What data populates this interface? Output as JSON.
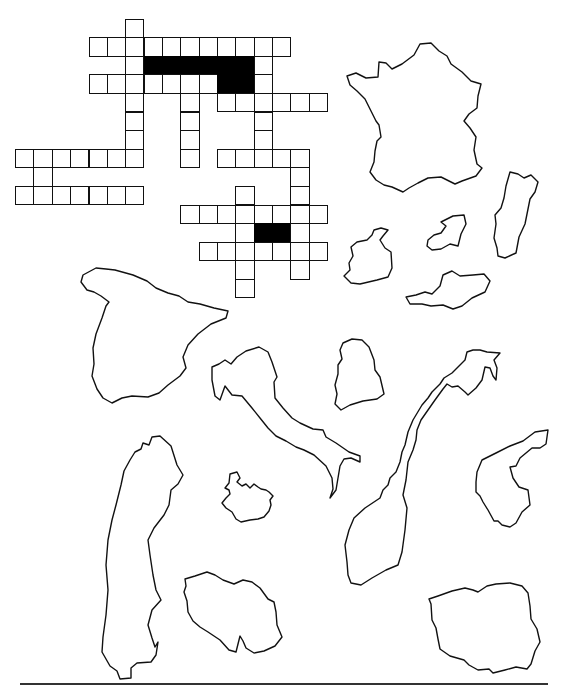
{
  "worksheet": {
    "title": "European countries crossword with outline maps",
    "crossword": {
      "cell_origin_note": "grid coordinates: row index, column index (column 0 = first cell of the long top-left across row)",
      "cells": [
        {
          "r": 0,
          "c": 2
        },
        {
          "r": 1,
          "c": 0
        },
        {
          "r": 1,
          "c": 1
        },
        {
          "r": 1,
          "c": 2
        },
        {
          "r": 1,
          "c": 3
        },
        {
          "r": 1,
          "c": 4
        },
        {
          "r": 1,
          "c": 5
        },
        {
          "r": 1,
          "c": 6
        },
        {
          "r": 1,
          "c": 7
        },
        {
          "r": 1,
          "c": 8
        },
        {
          "r": 1,
          "c": 9
        },
        {
          "r": 1,
          "c": 10
        },
        {
          "r": 2,
          "c": 2
        },
        {
          "r": 2,
          "c": 3,
          "black": true
        },
        {
          "r": 2,
          "c": 4,
          "black": true
        },
        {
          "r": 2,
          "c": 5,
          "black": true
        },
        {
          "r": 2,
          "c": 6,
          "black": true
        },
        {
          "r": 2,
          "c": 7,
          "black": true
        },
        {
          "r": 2,
          "c": 8,
          "black": true
        },
        {
          "r": 2,
          "c": 9
        },
        {
          "r": 3,
          "c": 0
        },
        {
          "r": 3,
          "c": 1
        },
        {
          "r": 3,
          "c": 2
        },
        {
          "r": 3,
          "c": 3
        },
        {
          "r": 3,
          "c": 4
        },
        {
          "r": 3,
          "c": 5
        },
        {
          "r": 3,
          "c": 6
        },
        {
          "r": 3,
          "c": 7,
          "black": true
        },
        {
          "r": 3,
          "c": 8,
          "black": true
        },
        {
          "r": 3,
          "c": 9
        },
        {
          "r": 4,
          "c": 2
        },
        {
          "r": 4,
          "c": 5
        },
        {
          "r": 4,
          "c": 7
        },
        {
          "r": 4,
          "c": 8
        },
        {
          "r": 4,
          "c": 9
        },
        {
          "r": 4,
          "c": 10
        },
        {
          "r": 4,
          "c": 11
        },
        {
          "r": 4,
          "c": 12
        },
        {
          "r": 5,
          "c": 2
        },
        {
          "r": 5,
          "c": 5
        },
        {
          "r": 5,
          "c": 9
        },
        {
          "r": 6,
          "c": 2
        },
        {
          "r": 6,
          "c": 5
        },
        {
          "r": 6,
          "c": 9
        },
        {
          "r": 7,
          "c": -4
        },
        {
          "r": 7,
          "c": -3
        },
        {
          "r": 7,
          "c": -2
        },
        {
          "r": 7,
          "c": -1
        },
        {
          "r": 7,
          "c": 0
        },
        {
          "r": 7,
          "c": 1
        },
        {
          "r": 7,
          "c": 2
        },
        {
          "r": 7,
          "c": 5
        },
        {
          "r": 7,
          "c": 7
        },
        {
          "r": 7,
          "c": 8
        },
        {
          "r": 7,
          "c": 9
        },
        {
          "r": 7,
          "c": 10
        },
        {
          "r": 7,
          "c": 11
        },
        {
          "r": 8,
          "c": -3
        },
        {
          "r": 8,
          "c": 11
        },
        {
          "r": 9,
          "c": -4
        },
        {
          "r": 9,
          "c": -3
        },
        {
          "r": 9,
          "c": -2
        },
        {
          "r": 9,
          "c": -1
        },
        {
          "r": 9,
          "c": 0
        },
        {
          "r": 9,
          "c": 1
        },
        {
          "r": 9,
          "c": 2
        },
        {
          "r": 9,
          "c": 8
        },
        {
          "r": 9,
          "c": 11
        },
        {
          "r": 10,
          "c": 5
        },
        {
          "r": 10,
          "c": 6
        },
        {
          "r": 10,
          "c": 7
        },
        {
          "r": 10,
          "c": 8
        },
        {
          "r": 10,
          "c": 9
        },
        {
          "r": 10,
          "c": 10
        },
        {
          "r": 10,
          "c": 11
        },
        {
          "r": 10,
          "c": 12
        },
        {
          "r": 11,
          "c": 8
        },
        {
          "r": 11,
          "c": 9,
          "black": true
        },
        {
          "r": 11,
          "c": 10,
          "black": true
        },
        {
          "r": 11,
          "c": 11
        },
        {
          "r": 12,
          "c": 6
        },
        {
          "r": 12,
          "c": 7
        },
        {
          "r": 12,
          "c": 8
        },
        {
          "r": 12,
          "c": 9
        },
        {
          "r": 12,
          "c": 10
        },
        {
          "r": 12,
          "c": 11
        },
        {
          "r": 12,
          "c": 12
        },
        {
          "r": 13,
          "c": 8
        },
        {
          "r": 13,
          "c": 11
        },
        {
          "r": 14,
          "c": 8
        }
      ]
    },
    "maps": [
      {
        "name": "France",
        "icon": "france-outline"
      },
      {
        "name": "Portugal",
        "icon": "portugal-outline"
      },
      {
        "name": "Netherlands",
        "icon": "netherlands-outline"
      },
      {
        "name": "Ireland",
        "icon": "ireland-outline"
      },
      {
        "name": "Austria",
        "icon": "austria-outline"
      },
      {
        "name": "Spain",
        "icon": "spain-outline"
      },
      {
        "name": "Belgium",
        "icon": "belgium-outline"
      },
      {
        "name": "Italy",
        "icon": "italy-outline"
      },
      {
        "name": "Norway",
        "icon": "norway-outline"
      },
      {
        "name": "Denmark",
        "icon": "denmark-outline"
      },
      {
        "name": "Sweden",
        "icon": "sweden-outline"
      },
      {
        "name": "Iceland",
        "icon": "iceland-outline"
      },
      {
        "name": "Greece",
        "icon": "greece-outline"
      },
      {
        "name": "Poland",
        "icon": "poland-outline"
      }
    ]
  }
}
